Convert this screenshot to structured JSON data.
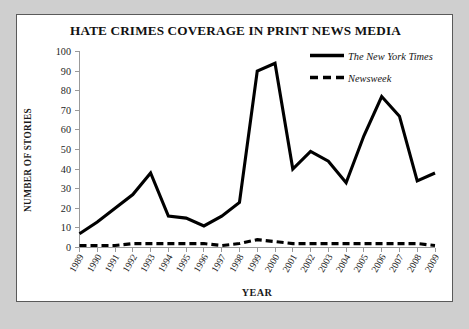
{
  "chart_data": {
    "type": "line",
    "title": "HATE CRIMES COVERAGE IN PRINT NEWS MEDIA",
    "xlabel": "YEAR",
    "ylabel": "NUMBER OF STORIES",
    "categories": [
      "1989",
      "1990",
      "1991",
      "1992",
      "1993",
      "1994",
      "1995",
      "1996",
      "1997",
      "1998",
      "1999",
      "2000",
      "2001",
      "2002",
      "2003",
      "2004",
      "2005",
      "2006",
      "2007",
      "2008",
      "2009"
    ],
    "series": [
      {
        "name": "The New York Times",
        "style": "solid",
        "color": "#000000",
        "values": [
          7,
          13,
          20,
          27,
          38,
          16,
          15,
          11,
          16,
          23,
          90,
          94,
          40,
          49,
          44,
          33,
          57,
          77,
          67,
          34,
          38
        ]
      },
      {
        "name": "Newsweek",
        "style": "dashed",
        "color": "#000000",
        "values": [
          1,
          1,
          1,
          2,
          2,
          2,
          2,
          2,
          1,
          2,
          4,
          3,
          2,
          2,
          2,
          2,
          2,
          2,
          2,
          2,
          1
        ]
      }
    ],
    "yticks": [
      0,
      10,
      20,
      30,
      40,
      50,
      60,
      70,
      80,
      90,
      100
    ],
    "ylim": [
      0,
      100
    ],
    "grid": false,
    "legend_position": "top-right"
  },
  "legend": {
    "entries": [
      {
        "label": "The New York Times"
      },
      {
        "label": "Newsweek"
      }
    ]
  }
}
